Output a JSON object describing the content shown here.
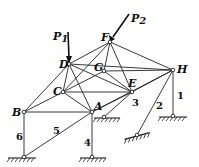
{
  "diagram": {
    "type": "space-truss",
    "nodes": [
      {
        "id": "A",
        "label": "A",
        "x": 92,
        "y": 112
      },
      {
        "id": "B",
        "label": "B",
        "x": 24,
        "y": 112
      },
      {
        "id": "C",
        "label": "C",
        "x": 63,
        "y": 92
      },
      {
        "id": "D",
        "label": "D",
        "x": 69,
        "y": 64
      },
      {
        "id": "E",
        "label": "E",
        "x": 132,
        "y": 92
      },
      {
        "id": "F",
        "label": "F",
        "x": 110,
        "y": 42
      },
      {
        "id": "G",
        "label": "G",
        "x": 104,
        "y": 71
      },
      {
        "id": "H",
        "label": "H",
        "x": 173,
        "y": 70
      }
    ],
    "loads": [
      {
        "label": "P",
        "subscript": "1",
        "at": "D"
      },
      {
        "label": "P",
        "subscript": "2",
        "at": "F"
      }
    ],
    "supports": [
      {
        "label": "1",
        "from": "H"
      },
      {
        "label": "2",
        "from": "H"
      },
      {
        "label": "3",
        "from": "E"
      },
      {
        "label": "4",
        "from": "A"
      },
      {
        "label": "5",
        "from": "A"
      },
      {
        "label": "6",
        "from": "B"
      }
    ]
  }
}
